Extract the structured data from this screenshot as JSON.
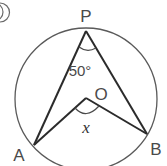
{
  "diagram": {
    "type": "inscribed-angle-geometry",
    "problem_marker": "①",
    "circle": {
      "center": [
        86,
        99
      ],
      "radius": 71,
      "stroke": "#5a5a5a"
    },
    "points": {
      "P": {
        "label": "P",
        "x": 86,
        "y": 31
      },
      "A": {
        "label": "A",
        "x": 34,
        "y": 145
      },
      "B": {
        "label": "B",
        "x": 147,
        "y": 134
      },
      "O": {
        "label": "O",
        "x": 86,
        "y": 98
      }
    },
    "angles": {
      "APB": {
        "label": "50°",
        "value": 50
      },
      "AOB": {
        "label": "x"
      }
    },
    "segments": [
      "PA",
      "PB",
      "OA",
      "OB"
    ],
    "line_color": "#2b2b2b"
  }
}
